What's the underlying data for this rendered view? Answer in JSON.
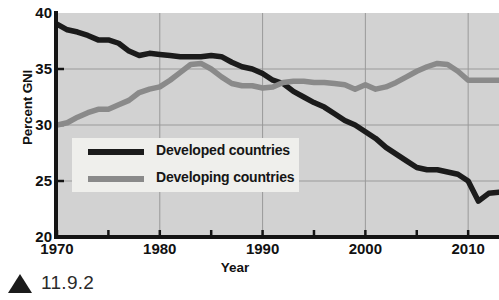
{
  "caption": {
    "marker": "triangle-up",
    "text": "11.9.2"
  },
  "axes": {
    "ylabel": "Percent GNI",
    "xlabel": "Year",
    "yticks": [
      "20",
      "25",
      "30",
      "35",
      "40"
    ],
    "xticks": [
      "1970",
      "1980",
      "1990",
      "2000",
      "2010"
    ]
  },
  "legend": {
    "items": [
      {
        "label": "Developed countries",
        "color": "#1b1b1b"
      },
      {
        "label": "Developing countries",
        "color": "#8a8a8a"
      }
    ]
  },
  "colors": {
    "plot_background": "#d2d2d2",
    "gridline": "#9a9a9a",
    "axis": "#141414",
    "developed_line": "#1b1b1b",
    "developing_line": "#8a8a8a",
    "legend_background": "#efefec",
    "page_background": "#ffffff"
  },
  "chart_data": {
    "type": "line",
    "title": "",
    "subtitle": "",
    "xlabel": "Year",
    "ylabel": "Percent GNI",
    "xlim": [
      1970,
      2013
    ],
    "ylim": [
      20,
      40
    ],
    "ytick_values": [
      20,
      25,
      30,
      35,
      40
    ],
    "xtick_values": [
      1970,
      1980,
      1990,
      2000,
      2010
    ],
    "xminor_step": 5,
    "grid": true,
    "legend_position": "inside-lower-left",
    "x": [
      1970,
      1971,
      1972,
      1973,
      1974,
      1975,
      1976,
      1977,
      1978,
      1979,
      1980,
      1981,
      1982,
      1983,
      1984,
      1985,
      1986,
      1987,
      1988,
      1989,
      1990,
      1991,
      1992,
      1993,
      1994,
      1995,
      1996,
      1997,
      1998,
      1999,
      2000,
      2001,
      2002,
      2003,
      2004,
      2005,
      2006,
      2007,
      2008,
      2009,
      2010,
      2011,
      2012,
      2013
    ],
    "series": [
      {
        "name": "Developed countries",
        "color": "#1b1b1b",
        "values": [
          39.0,
          38.5,
          38.3,
          38.0,
          37.6,
          37.6,
          37.3,
          36.6,
          36.2,
          36.4,
          36.3,
          36.2,
          36.1,
          36.1,
          36.1,
          36.2,
          36.1,
          35.6,
          35.2,
          35.0,
          34.6,
          34.0,
          33.7,
          33.0,
          32.5,
          32.0,
          31.6,
          31.0,
          30.4,
          30.0,
          29.4,
          28.8,
          28.0,
          27.4,
          26.8,
          26.2,
          26.0,
          26.0,
          25.8,
          25.6,
          25.0,
          23.2,
          23.9,
          24.0
        ]
      },
      {
        "name": "Developing countries",
        "color": "#8a8a8a",
        "values": [
          30.0,
          30.2,
          30.7,
          31.1,
          31.4,
          31.4,
          31.8,
          32.2,
          32.9,
          33.2,
          33.4,
          34.0,
          34.7,
          35.4,
          35.5,
          35.0,
          34.3,
          33.7,
          33.5,
          33.5,
          33.3,
          33.4,
          33.8,
          33.9,
          33.9,
          33.8,
          33.8,
          33.7,
          33.6,
          33.2,
          33.6,
          33.2,
          33.4,
          33.8,
          34.3,
          34.8,
          35.2,
          35.5,
          35.4,
          34.8,
          34.0,
          34.0,
          34.0,
          34.0
        ]
      }
    ]
  }
}
